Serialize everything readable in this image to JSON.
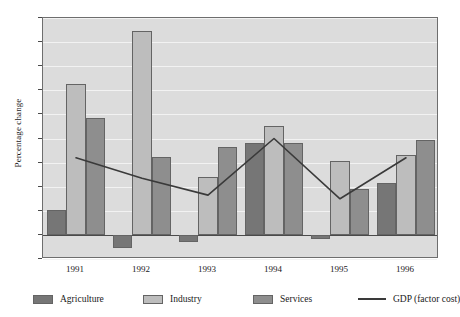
{
  "chart_data": {
    "type": "bar",
    "title": "",
    "xlabel": "",
    "ylabel": "Percentage change",
    "ylim": [
      -2,
      18
    ],
    "ytick_step": 2,
    "grid": true,
    "legend_position": "bottom",
    "categories": [
      "1991",
      "1992",
      "1993",
      "1994",
      "1995",
      "1996"
    ],
    "series": [
      {
        "name": "Agriculture",
        "type": "bar",
        "color": "#767676",
        "values": [
          2.1,
          -1.1,
          -0.6,
          7.6,
          -0.3,
          4.3
        ]
      },
      {
        "name": "Industry",
        "type": "bar",
        "color": "#bdbdbd",
        "values": [
          12.5,
          16.9,
          4.8,
          9.0,
          6.1,
          6.6
        ]
      },
      {
        "name": "Services",
        "type": "bar",
        "color": "#8e8e8e",
        "values": [
          9.7,
          6.5,
          7.3,
          7.6,
          3.8,
          7.9
        ]
      },
      {
        "name": "GDP (factor cost)",
        "type": "line",
        "color": "#3a3a3a",
        "values": [
          6.4,
          4.7,
          3.3,
          8.0,
          3.0,
          6.4
        ]
      }
    ],
    "ytick_labels": [
      "18",
      "16",
      "14",
      "12",
      "10",
      "8",
      "6",
      "4",
      "2",
      "0",
      "-2"
    ]
  },
  "legend": {
    "items": [
      {
        "label": "Agriculture",
        "kind": "swatch",
        "variant": "agriculture"
      },
      {
        "label": "Industry",
        "kind": "swatch",
        "variant": "industry"
      },
      {
        "label": "Services",
        "kind": "swatch",
        "variant": "services"
      },
      {
        "label": "GDP (factor cost)",
        "kind": "line",
        "variant": "gdp"
      }
    ]
  }
}
